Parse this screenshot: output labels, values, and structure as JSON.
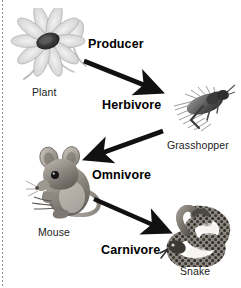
{
  "diagram": {
    "background_color": "#ffffff",
    "label_color": "#1c1c1c",
    "arrow_color": "#111111",
    "left_rule": {
      "name": "dotted-margin-rule",
      "color": "#8a8a8a",
      "style": "dotted"
    }
  },
  "organisms": [
    {
      "id": "plant",
      "caption": "Plant",
      "art": "flower-illustration",
      "x": 10,
      "y": 8,
      "w": 84,
      "h": 76,
      "caption_x": 32,
      "caption_y": 86
    },
    {
      "id": "grasshopper",
      "caption": "Grasshopper",
      "art": "grasshopper-illustration",
      "x": 165,
      "y": 76,
      "w": 70,
      "h": 60,
      "caption_x": 167,
      "caption_y": 139
    },
    {
      "id": "mouse",
      "caption": "Mouse",
      "art": "mouse-illustration",
      "x": 24,
      "y": 145,
      "w": 84,
      "h": 78,
      "caption_x": 38,
      "caption_y": 226
    },
    {
      "id": "snake",
      "caption": "Snake",
      "art": "snake-illustration",
      "x": 157,
      "y": 205,
      "w": 78,
      "h": 62,
      "caption_x": 180,
      "caption_y": 265
    }
  ],
  "roles": [
    {
      "id": "producer",
      "label": "Producer",
      "x": 88,
      "y": 37
    },
    {
      "id": "herbivore",
      "label": "Herbivore",
      "x": 102,
      "y": 98
    },
    {
      "id": "omnivore",
      "label": "Omnivore",
      "x": 92,
      "y": 168
    },
    {
      "id": "carnivore",
      "label": "Carnivore",
      "x": 101,
      "y": 243
    }
  ],
  "arrows": [
    {
      "id": "plant-to-grasshopper",
      "from": "plant",
      "to": "grasshopper",
      "x1": 84,
      "y1": 61,
      "x2": 159,
      "y2": 91,
      "direction": "down-right"
    },
    {
      "id": "grasshopper-to-mouse",
      "from": "grasshopper",
      "to": "mouse",
      "x1": 163,
      "y1": 131,
      "x2": 88,
      "y2": 158,
      "direction": "down-left"
    },
    {
      "id": "mouse-to-snake",
      "from": "mouse",
      "to": "snake",
      "x1": 94,
      "y1": 199,
      "x2": 167,
      "y2": 231,
      "direction": "down-right"
    }
  ]
}
